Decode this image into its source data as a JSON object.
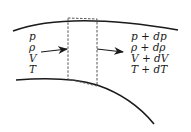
{
  "diagram": {
    "title": "",
    "inlet_labels": [
      "p",
      "ρ",
      "V",
      "T"
    ],
    "outlet_labels": [
      "p + dp",
      "ρ + dρ",
      "V + dV",
      "T + dT"
    ],
    "elements": {
      "upper_wall": "curved duct wall (top)",
      "lower_wall": "curved duct wall (bottom)",
      "control_volume": "dashed rectangular control volume",
      "inflow_arrow": "flow in",
      "outflow_arrow": "flow out"
    },
    "colors": {
      "stroke": "#1a1a1a",
      "dashed": "#555555",
      "background": "#ffffff"
    }
  }
}
